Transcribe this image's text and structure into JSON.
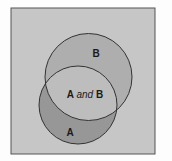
{
  "diagram": {
    "type": "venn",
    "colors": {
      "page_background": "#fdfdfd",
      "universe_fill": "#c6c6c6",
      "universe_stroke": "#555555",
      "circle_b_fill": "#aeaeae",
      "circle_a_fill": "#979797",
      "intersection_fill": "#bdbdbd",
      "stroke": "#333333"
    },
    "universe": {
      "x": 11,
      "y": 8,
      "width": 144,
      "height": 146
    },
    "sets": [
      {
        "id": "B",
        "label": "B",
        "cx": 88.5,
        "cy": 77,
        "r": 43.5,
        "label_x": 96,
        "label_y": 57
      },
      {
        "id": "A",
        "label": "A",
        "cx": 78,
        "cy": 105,
        "r": 39,
        "label_x": 70,
        "label_y": 136
      }
    ],
    "intersection": {
      "label_a": "A",
      "label_and": "and",
      "label_b": "B",
      "label_x": 85,
      "label_y": 98
    }
  }
}
